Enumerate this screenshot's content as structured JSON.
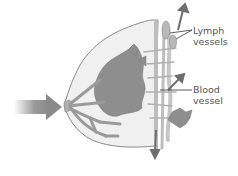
{
  "diagram": {
    "labels": {
      "lymph": "Lymph\nvessels",
      "blood": "Blood\nvessel"
    },
    "colors": {
      "outline": "#8a8a8a",
      "fill": "#ececec",
      "tissue": "#8c8c8c",
      "vessel": "#c9c9c9",
      "arrow": "#6e6e6e",
      "big_arrow": "#8a8a8a",
      "text": "#555555"
    }
  }
}
